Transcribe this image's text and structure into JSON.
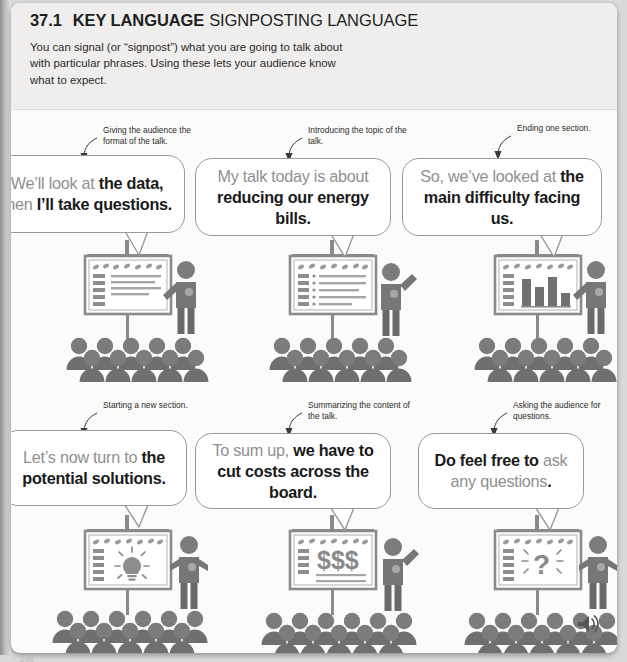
{
  "page": {
    "number": "205",
    "unit_number": "37.1",
    "key_language_label": "KEY LANGUAGE",
    "topic_title": "SIGNPOSTING LANGUAGE",
    "intro": "You can signal (or “signpost”) what you are going to talk about with particular phrases. Using these lets your audience know what to expect.",
    "audio_icon": "speaker-icon"
  },
  "panels": [
    {
      "id": "panel-1",
      "caption": "Giving the audience the format of the talk.",
      "phrase_plain": "We’ll look at the data, then I’ll take questions.",
      "segments": [
        {
          "text": "We’ll look at ",
          "style": "gray"
        },
        {
          "text": "the data,",
          "style": "black"
        },
        {
          "text": " then ",
          "style": "gray"
        },
        {
          "text": "I’ll take questions.",
          "style": "black"
        }
      ],
      "illustration": "presenter-with-list-slide",
      "slide_content": "bulleted-list"
    },
    {
      "id": "panel-2",
      "caption": "Introducing the topic of the talk.",
      "phrase_plain": "My talk today is about reducing our energy bills.",
      "segments": [
        {
          "text": "My talk today is about ",
          "style": "gray"
        },
        {
          "text": "reducing our energy bills.",
          "style": "black"
        }
      ],
      "illustration": "presenter-pointing-at-slide",
      "slide_content": "bulleted-list"
    },
    {
      "id": "panel-3",
      "caption": "Ending one section.",
      "phrase_plain": "So, we’ve looked at the main difficulty facing us.",
      "segments": [
        {
          "text": "So, we’ve looked at ",
          "style": "gray"
        },
        {
          "text": "the main difficulty facing us.",
          "style": "black"
        }
      ],
      "illustration": "presenter-with-bar-chart-slide",
      "slide_content": "bar-chart"
    },
    {
      "id": "panel-4",
      "caption": "Starting a new section.",
      "phrase_plain": "Let’s now turn to the potential solutions.",
      "segments": [
        {
          "text": "Let’s now turn to ",
          "style": "gray"
        },
        {
          "text": "the potential solutions.",
          "style": "black"
        }
      ],
      "illustration": "presenter-with-lightbulb-slide",
      "slide_content": "lightbulb"
    },
    {
      "id": "panel-5",
      "caption": "Summarizing the content of the talk.",
      "phrase_plain": "To sum up, we have to cut costs across the board.",
      "segments": [
        {
          "text": "To sum up, ",
          "style": "gray"
        },
        {
          "text": "we have to cut costs across the board.",
          "style": "black"
        }
      ],
      "illustration": "presenter-with-money-slide",
      "slide_content": "$$$"
    },
    {
      "id": "panel-6",
      "caption": "Asking the audience for questions.",
      "phrase_plain": "Do feel free to ask any questions.",
      "segments": [
        {
          "text": "Do feel free to ",
          "style": "black"
        },
        {
          "text": "ask any questions",
          "style": "gray"
        },
        {
          "text": ".",
          "style": "black"
        }
      ],
      "illustration": "presenter-with-question-slide",
      "slide_content": "question-mark"
    }
  ],
  "colors": {
    "page_bg": "#fbfbfa",
    "header_bg": "#efeeec",
    "bubble_border": "#9a9a9a",
    "text_black": "#1a1a1a",
    "text_gray": "#8f8f8f",
    "illustration_gray": "#7c7c7c"
  }
}
